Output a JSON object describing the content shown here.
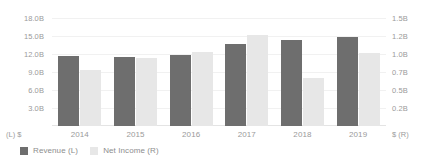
{
  "chart_data": {
    "type": "bar",
    "title": "",
    "subtitle": "",
    "xlabel": "",
    "ylabel": "",
    "grid": true,
    "legend_position": "bottom-left",
    "categories": [
      "2014",
      "2015",
      "2016",
      "2017",
      "2018",
      "2019"
    ],
    "series": [
      {
        "name": "Revenue (L)",
        "axis": "left",
        "color": "#6e6e6e",
        "values": [
          11.6,
          11.5,
          11.9,
          13.6,
          14.4,
          14.8
        ]
      },
      {
        "name": "Net Income (R)",
        "axis": "right",
        "color": "#e7e7e7",
        "values": [
          0.78,
          0.94,
          1.03,
          1.26,
          0.66,
          1.02
        ]
      }
    ],
    "left_axis": {
      "unit_caption": "(L)  $",
      "ylim": [
        0,
        18
      ],
      "ticks": [
        "18.0B",
        "15.0B",
        "12.0B",
        "9.0B",
        "6.0B",
        "3.0B"
      ],
      "tick_values": [
        18,
        15,
        12,
        9,
        6,
        3
      ]
    },
    "right_axis": {
      "unit_caption": "$  (R)",
      "ylim": [
        0,
        1.5
      ],
      "ticks": [
        "1.5B",
        "1.2B",
        "1.0B",
        "0.7B",
        "0.5B",
        "0.2B"
      ],
      "tick_values": [
        1.5,
        1.25,
        1.0,
        0.75,
        0.5,
        0.25
      ]
    },
    "legend": [
      {
        "label": "Revenue (L)",
        "color": "#6e6e6e"
      },
      {
        "label": "Net Income (R)",
        "color": "#e7e7e7"
      }
    ]
  }
}
